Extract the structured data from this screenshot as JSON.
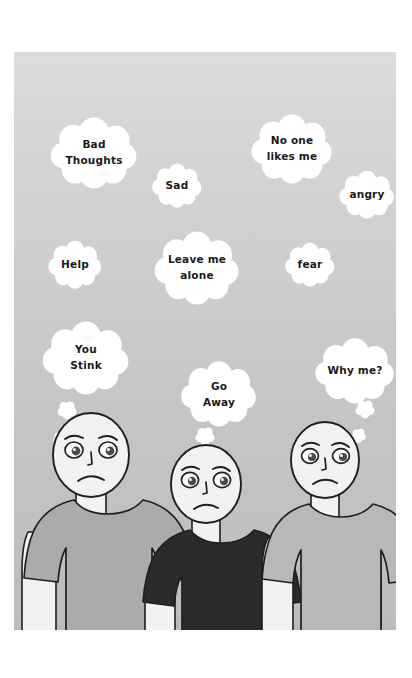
{
  "scene": {
    "title": "Bullying thought bubbles illustration",
    "description": "Three cartoon figures with sad expressions under a sky of thought bubbles containing negative thoughts",
    "panel": {
      "x": 14,
      "y": 52,
      "width": 382,
      "height": 578,
      "background_top": "#d9d9d9",
      "background_bottom": "#bdbdbd",
      "page_background": "#ffffff"
    },
    "colors": {
      "bubble_fill": "#ffffff",
      "text": "#1a1a1a",
      "outline": "#1f1f1f",
      "skin": "#f2f2f0",
      "shirt_left": "#ababab",
      "shirt_center": "#2b2b2b",
      "shirt_right": "#b8b8b8",
      "eye_iris": "#4d4d4d"
    }
  },
  "thought_bubbles": [
    {
      "id": "bad-thoughts",
      "lines": [
        "Bad",
        "Thoughts"
      ],
      "cx": 80,
      "cy": 100,
      "rx": 47,
      "ry": 37,
      "font": "normal"
    },
    {
      "id": "no-one-likes-me",
      "lines": [
        "No one",
        "likes me"
      ],
      "cx": 278,
      "cy": 96,
      "rx": 44,
      "ry": 36,
      "font": "normal"
    },
    {
      "id": "sad",
      "lines": [
        "Sad"
      ],
      "cx": 163,
      "cy": 133,
      "rx": 27,
      "ry": 23,
      "font": "normal"
    },
    {
      "id": "angry",
      "lines": [
        "angry"
      ],
      "cx": 353,
      "cy": 142,
      "rx": 30,
      "ry": 25,
      "font": "normal"
    },
    {
      "id": "help",
      "lines": [
        "Help"
      ],
      "cx": 61,
      "cy": 212,
      "rx": 29,
      "ry": 25,
      "font": "normal"
    },
    {
      "id": "leave-me-alone",
      "lines": [
        "Leave me",
        "alone"
      ],
      "cx": 183,
      "cy": 215,
      "rx": 46,
      "ry": 38,
      "font": "normal"
    },
    {
      "id": "fear",
      "lines": [
        "fear"
      ],
      "cx": 296,
      "cy": 212,
      "rx": 27,
      "ry": 23,
      "font": "normal"
    },
    {
      "id": "you-stink",
      "lines": [
        "You",
        "Stink"
      ],
      "cx": 72,
      "cy": 305,
      "rx": 47,
      "ry": 38,
      "font": "normal"
    },
    {
      "id": "go-away",
      "lines": [
        "Go",
        "Away"
      ],
      "cx": 205,
      "cy": 341,
      "rx": 41,
      "ry": 34,
      "font": "normal"
    },
    {
      "id": "why-me",
      "lines": [
        "Why me?"
      ],
      "cx": 341,
      "cy": 318,
      "rx": 43,
      "ry": 34,
      "font": "normal"
    }
  ],
  "bubble_trails": [
    {
      "id": "trail-you-stink-1",
      "cx": 53,
      "cy": 358,
      "r": 11
    },
    {
      "id": "trail-you-stink-2",
      "cx": 46,
      "cy": 386,
      "r": 8
    },
    {
      "id": "trail-go-away-1",
      "cx": 191,
      "cy": 384,
      "r": 11
    },
    {
      "id": "trail-go-away-2",
      "cx": 183,
      "cy": 411,
      "r": 8
    },
    {
      "id": "trail-why-me-1",
      "cx": 351,
      "cy": 357,
      "r": 11
    },
    {
      "id": "trail-why-me-2",
      "cx": 344,
      "cy": 383,
      "r": 8
    }
  ],
  "figures": [
    {
      "id": "figure-left",
      "label": "left-person",
      "shirt_color": "#ababab",
      "head_cx": 77,
      "head_cy": 403,
      "head_rx": 38,
      "head_ry": 42,
      "expression": "sad-frown"
    },
    {
      "id": "figure-center",
      "label": "center-person",
      "shirt_color": "#2b2b2b",
      "head_cx": 192,
      "head_cy": 432,
      "head_rx": 35,
      "head_ry": 39,
      "expression": "sad-frown"
    },
    {
      "id": "figure-right",
      "label": "right-person",
      "shirt_color": "#b8b8b8",
      "head_cx": 311,
      "head_cy": 408,
      "head_rx": 34,
      "head_ry": 38,
      "expression": "sad-frown"
    }
  ]
}
